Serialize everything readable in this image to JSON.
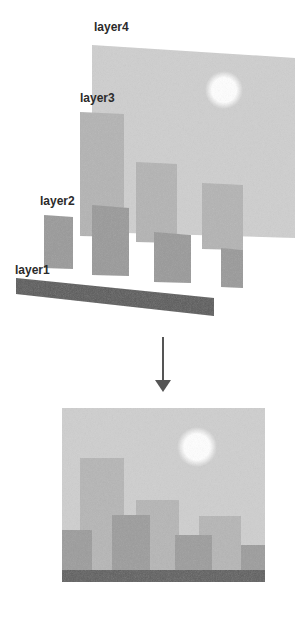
{
  "diagram": {
    "title": "",
    "exploded_view": {
      "layers": [
        {
          "id": "layer4",
          "label": "layer4",
          "content": "sky with sun",
          "fill": "#cfcfcf"
        },
        {
          "id": "layer3",
          "label": "layer3",
          "content": "far buildings",
          "fill": "#b4b4b4"
        },
        {
          "id": "layer2",
          "label": "layer2",
          "content": "near buildings",
          "fill": "#9a9a9a"
        },
        {
          "id": "layer1",
          "label": "layer1",
          "content": "ground strip",
          "fill": "#5a5a5a"
        }
      ],
      "sun_color": "#ffffff"
    },
    "arrow": {
      "direction": "down",
      "color": "#555555"
    },
    "composite_view": {
      "content": "flattened result of layers 1-4",
      "sky_fill": "#cfcfcf",
      "far_building_fill": "#b6b6b6",
      "near_building_fill": "#9c9c9c",
      "ground_fill": "#5e5e5e"
    }
  }
}
